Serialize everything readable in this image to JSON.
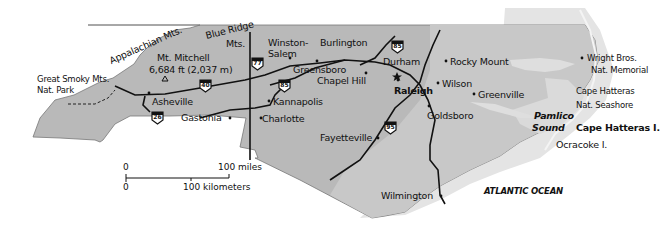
{
  "map": {
    "region": "North Carolina",
    "colors": {
      "land": "#b4b4b4",
      "land_light": "#cfcfcf",
      "coastal_plain": "#c6c6c6",
      "ocean_shelf": "#e6e6e6",
      "road": "#111111",
      "background": "#ffffff"
    },
    "labels": {
      "appalachian": "Appalachian Mts.",
      "blue_ridge_1": "Blue Ridge",
      "blue_ridge_2": "Mts.",
      "mt_mitchell_1": "Mt. Mitchell",
      "mt_mitchell_2": "6,684 ft (2,037 m)",
      "smoky_1": "Great Smoky Mts.",
      "smoky_2": "Nat. Park",
      "winston_1": "Winston-",
      "winston_2": "Salem",
      "burlington": "Burlington",
      "durham": "Durham",
      "greensboro": "Greensboro",
      "chapel_hill": "Chapel Hill",
      "raleigh": "Raleigh",
      "rocky_mount": "Rocky Mount",
      "wilson": "Wilson",
      "greenville": "Greenville",
      "goldsboro": "Goldsboro",
      "asheville": "Asheville",
      "kannapolis": "Kannapolis",
      "gastonia": "Gastonia",
      "charlotte": "Charlotte",
      "fayetteville": "Fayetteville",
      "wilmington": "Wilmington",
      "wright_1": "Wright Bros.",
      "wright_2": "Nat. Memorial",
      "hatteras_ns_1": "Cape Hatteras",
      "hatteras_ns_2": "Nat. Seashore",
      "pamlico_1": "Pamlico",
      "pamlico_2": "Sound",
      "hatteras_i": "Cape Hatteras I.",
      "ocracoke": "Ocracoke I.",
      "atlantic": "ATLANTIC OCEAN"
    },
    "highways": {
      "i40": "40",
      "i77": "77",
      "i85_west": "85",
      "i85_east": "85",
      "i26": "26",
      "i95": "95"
    },
    "scale": {
      "miles_zero": "0",
      "miles_label": "100 miles",
      "km_zero": "0",
      "km_label": "100 kilometers"
    }
  }
}
